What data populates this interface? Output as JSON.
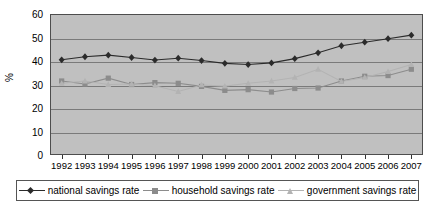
{
  "chart_data": {
    "type": "line",
    "title": "",
    "xlabel": "",
    "ylabel": "%",
    "ylim": [
      0,
      60
    ],
    "ytick_values": [
      0,
      10,
      20,
      30,
      40,
      50,
      60
    ],
    "grid": true,
    "legend_position": "bottom",
    "categories": [
      "1992",
      "1993",
      "1994",
      "1995",
      "1996",
      "1997",
      "1998",
      "1999",
      "2000",
      "2001",
      "2002",
      "2003",
      "2004",
      "2005",
      "2006",
      "2007"
    ],
    "series": [
      {
        "name": "national savings rate",
        "marker": "diamond",
        "color": "#2b2b2b",
        "values": [
          40.5,
          41.8,
          42.5,
          41.5,
          40.4,
          41.2,
          40.2,
          39.0,
          38.5,
          39.2,
          41.0,
          43.5,
          46.5,
          48.0,
          49.5,
          51.0
        ]
      },
      {
        "name": "household savings rate",
        "marker": "square",
        "color": "#8c8c8c",
        "values": [
          31.5,
          30.2,
          32.7,
          30.0,
          30.8,
          30.5,
          29.2,
          27.5,
          27.8,
          26.8,
          28.3,
          28.5,
          31.5,
          33.5,
          33.8,
          36.5
        ]
      },
      {
        "name": "government savings rate",
        "marker": "triangle",
        "color": "#b3b3b3",
        "values": [
          30.5,
          31.5,
          30.0,
          30.2,
          29.5,
          27.0,
          29.8,
          29.3,
          30.5,
          31.5,
          33.0,
          36.5,
          31.3,
          33.0,
          35.5,
          38.5
        ]
      }
    ]
  },
  "legend": {
    "items": [
      {
        "label": "national savings rate"
      },
      {
        "label": "household savings rate"
      },
      {
        "label": "government savings rate"
      }
    ]
  },
  "colors": {
    "plot_background": "#c0c0c0",
    "gridline": "#7a7a7a",
    "frame": "#4d4d4d",
    "page_background": "#ffffff"
  }
}
